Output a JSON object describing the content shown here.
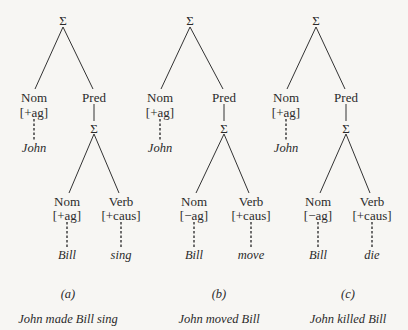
{
  "figure": {
    "trees": [
      {
        "id": "a",
        "root": "Σ",
        "subject": {
          "category": "Nom",
          "feature": "[+ag]",
          "word": "John"
        },
        "predicate": {
          "category": "Pred",
          "embedded_root": "Σ",
          "nominal": {
            "category": "Nom",
            "feature": "[+ag]",
            "word": "Bill"
          },
          "verb": {
            "category": "Verb",
            "feature": "[+caus]",
            "word": "sing"
          }
        },
        "label": "(a)",
        "caption": "John made Bill sing"
      },
      {
        "id": "b",
        "root": "Σ",
        "subject": {
          "category": "Nom",
          "feature": "[+ag]",
          "word": "John"
        },
        "predicate": {
          "category": "Pred",
          "embedded_root": "Σ",
          "nominal": {
            "category": "Nom",
            "feature": "[−ag]",
            "word": "Bill"
          },
          "verb": {
            "category": "Verb",
            "feature": "[+caus]",
            "word": "move"
          }
        },
        "label": "(b)",
        "caption": "John moved Bill"
      },
      {
        "id": "c",
        "root": "Σ",
        "subject": {
          "category": "Nom",
          "feature": "[+ag]",
          "word": "John"
        },
        "predicate": {
          "category": "Pred",
          "embedded_root": "Σ",
          "nominal": {
            "category": "Nom",
            "feature": "[−ag]",
            "word": "Bill"
          },
          "verb": {
            "category": "Verb",
            "feature": "[+caus]",
            "word": "die"
          }
        },
        "label": "(c)",
        "caption": "John killed Bill"
      }
    ]
  }
}
